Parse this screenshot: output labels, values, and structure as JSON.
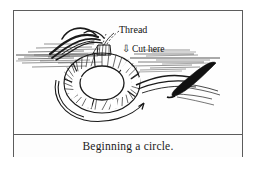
{
  "figure": {
    "caption": "Beginning a circle.",
    "labels": {
      "thread": "Thread",
      "cut_here": "Cut here",
      "cut_arrow_glyph": "⇩"
    },
    "icons": {
      "needle": "needle-icon",
      "direction_arrow": "curved-direction-arrow-icon",
      "cut_arrow": "down-arrow-icon"
    },
    "colors": {
      "ink": "#1a1a1a",
      "frame": "#5c5c5c",
      "paper": "#fefefe",
      "needle_fill": "#111111"
    }
  }
}
